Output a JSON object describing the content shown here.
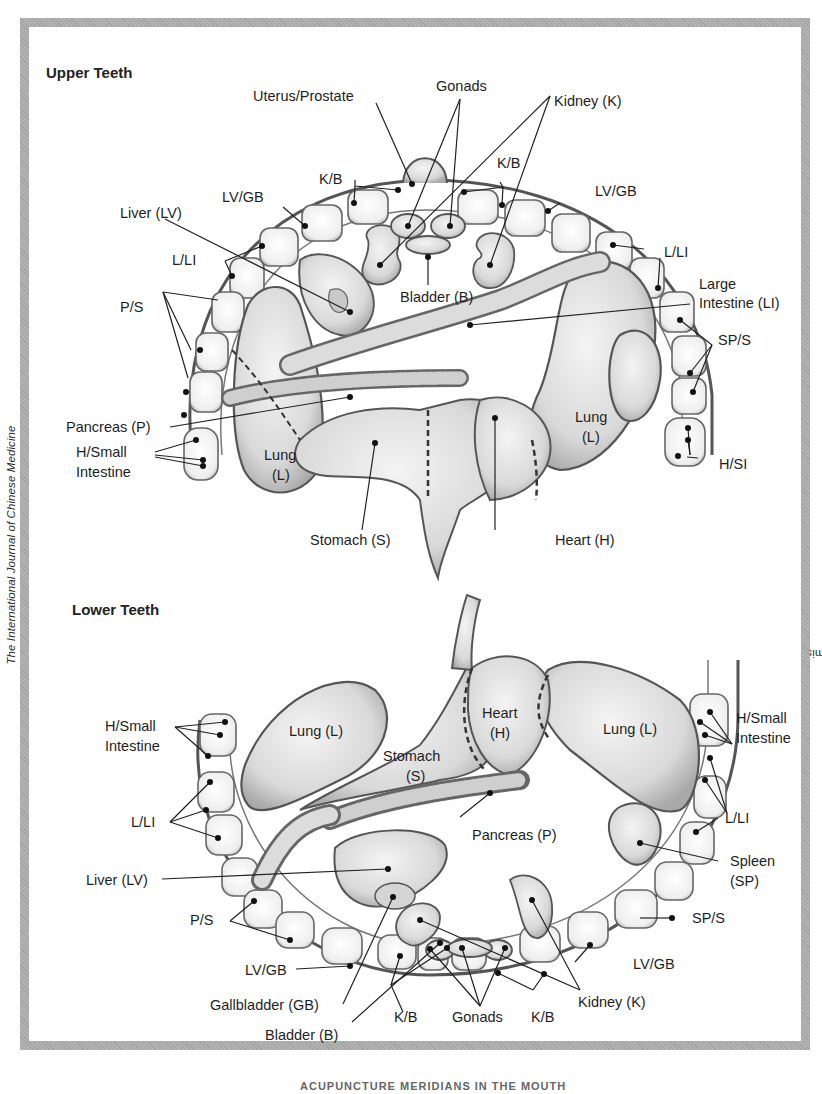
{
  "credit": {
    "prefix": "Used with permission from “The Micro-Acupuncture Systems III: The Principles and Systems of Micro-Acupuncture,” Ralph Alan Dale, ",
    "journal": "The International Journal of Chinese Medicine",
    "suffix": " 1:4 (1984)."
  },
  "caption": "ACUPUNCTURE MERIDIANS IN THE MOUTH",
  "upper": {
    "title": "Upper Teeth",
    "labels": {
      "uterus_prostate": "Uterus/Prostate",
      "gonads": "Gonads",
      "kidney": "Kidney (K)",
      "kb_left": "K/B",
      "kb_right": "K/B",
      "lvgb_left": "LV/GB",
      "lvgb_right": "LV/GB",
      "liver": "Liver (LV)",
      "lli_left": "L/LI",
      "lli_right": "L/LI",
      "large_intestine_1": "Large",
      "large_intestine_2": "Intestine (LI)",
      "bladder": "Bladder (B)",
      "ps": "P/S",
      "sps": "SP/S",
      "pancreas": "Pancreas (P)",
      "hsi_left_1": "H/Small",
      "hsi_left_2": "Intestine",
      "hsi_right": "H/SI",
      "lung_left_1": "Lung",
      "lung_left_2": "(L)",
      "lung_right_1": "Lung",
      "lung_right_2": "(L)",
      "stomach": "Stomach (S)",
      "heart": "Heart (H)"
    }
  },
  "lower": {
    "title": "Lower Teeth",
    "labels": {
      "hsi_left_1": "H/Small",
      "hsi_left_2": "Intestine",
      "hsi_right_1": "H/Small",
      "hsi_right_2": "Intestine",
      "lung_left": "Lung (L)",
      "lung_right": "Lung (L)",
      "stomach_1": "Stomach",
      "stomach_2": "(S)",
      "heart_1": "Heart",
      "heart_2": "(H)",
      "pancreas": "Pancreas (P)",
      "lli_left": "L/LI",
      "lli_right": "L/LI",
      "liver": "Liver (LV)",
      "spleen_1": "Spleen",
      "spleen_2": "(SP)",
      "sps": "SP/S",
      "ps": "P/S",
      "lvgb_left": "LV/GB",
      "lvgb_right": "LV/GB",
      "gallbladder": "Gallbladder (GB)",
      "bladder": "Bladder (B)",
      "kb_left": "K/B",
      "kb_right": "K/B",
      "gonads": "Gonads",
      "kidney": "Kidney (K)"
    }
  }
}
